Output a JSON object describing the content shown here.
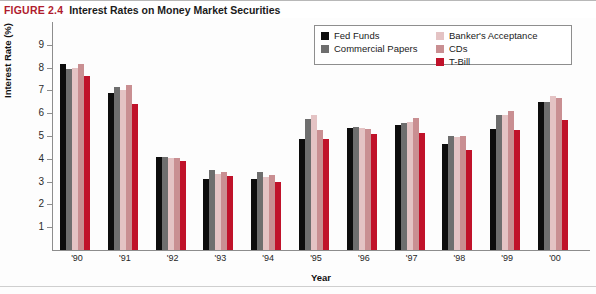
{
  "figure": {
    "number": "FIGURE 2.4",
    "title": "Interest Rates on Money Market Securities",
    "number_color": "#b01c2e",
    "title_color": "#1b1b1b"
  },
  "legend": {
    "position": "top-right-inside",
    "column_1": [
      {
        "label": "Fed Funds",
        "color": "#0d0d0d"
      },
      {
        "label": "Commercial Papers",
        "color": "#6e6e6e"
      }
    ],
    "column_2": [
      {
        "label": "Banker's Acceptance",
        "color": "#e4c3c4"
      },
      {
        "label": "CDs",
        "color": "#c98f92"
      },
      {
        "label": "T-Bill",
        "color": "#c0122a"
      }
    ]
  },
  "chart_data": {
    "type": "bar",
    "title": "Interest Rates on Money Market Securities",
    "xlabel": "Year",
    "ylabel": "Interest Rate (%)",
    "categories": [
      "'90",
      "'91",
      "'92",
      "'93",
      "'94",
      "'95",
      "'96",
      "'97",
      "'98",
      "'99",
      "'00"
    ],
    "ylim": [
      0,
      9.4
    ],
    "yticks": [
      1,
      2,
      3,
      4,
      5,
      6,
      7,
      8,
      9
    ],
    "ytick_labels": [
      "1",
      "2",
      "3",
      "4",
      "5",
      "6",
      "7",
      "8",
      "9"
    ],
    "grid": false,
    "legend_position": "upper right",
    "series": [
      {
        "name": "Fed Funds",
        "color": "#0d0d0d",
        "values": [
          8.15,
          6.9,
          4.1,
          3.1,
          3.1,
          4.85,
          5.35,
          5.5,
          4.65,
          5.3,
          6.5
        ]
      },
      {
        "name": "Commercial Papers",
        "color": "#6e6e6e",
        "values": [
          7.95,
          7.15,
          4.1,
          3.5,
          3.4,
          5.75,
          5.4,
          5.55,
          5.0,
          5.9,
          6.5
        ]
      },
      {
        "name": "Banker's Acceptance",
        "color": "#e4c3c4",
        "values": [
          8.0,
          7.0,
          4.05,
          3.35,
          3.2,
          5.9,
          5.35,
          5.6,
          4.95,
          5.9,
          6.75
        ]
      },
      {
        "name": "CDs",
        "color": "#c98f92",
        "values": [
          8.15,
          7.25,
          4.05,
          3.4,
          3.3,
          5.25,
          5.3,
          5.8,
          5.0,
          6.1,
          6.65
        ]
      },
      {
        "name": "T-Bill",
        "color": "#c0122a",
        "values": [
          7.65,
          6.4,
          3.9,
          3.25,
          3.0,
          4.85,
          5.1,
          5.15,
          4.4,
          5.25,
          5.7
        ]
      }
    ]
  }
}
